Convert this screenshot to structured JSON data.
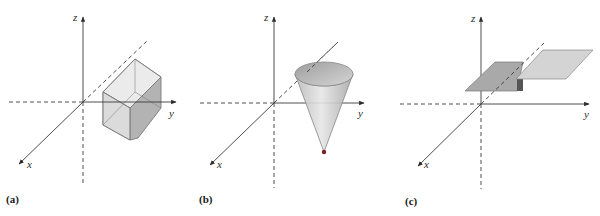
{
  "figure": {
    "panels": [
      {
        "id": "a",
        "caption": "(a)",
        "axes": {
          "x_label": "x",
          "y_label": "y",
          "z_label": "z"
        },
        "solid": "rectangular box (prism)"
      },
      {
        "id": "b",
        "caption": "(b)",
        "axes": {
          "x_label": "x",
          "y_label": "y",
          "z_label": "z"
        },
        "solid": "inverted cone"
      },
      {
        "id": "c",
        "caption": "(c)",
        "axes": {
          "x_label": "x",
          "y_label": "y",
          "z_label": "z"
        },
        "solid": "two stepped horizontal plates"
      }
    ],
    "colors": {
      "axis": "#3a3a3a",
      "box_light": "#e4e4e4",
      "box_mid": "#cfcfcf",
      "box_dark": "#a9a9a9",
      "cone_fill": "#c4c4c4",
      "plate_left": "#a8a8a8",
      "plate_right": "#d3d3d3"
    }
  }
}
